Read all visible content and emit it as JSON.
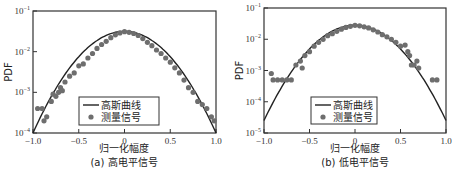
{
  "chart_data": [
    {
      "type": "scatter",
      "panel": "(a)",
      "title": "高电平信号",
      "caption": "(a) 高电平信号",
      "xlabel": "归一化幅度",
      "ylabel": "PDF",
      "xlim": [
        -1.0,
        1.0
      ],
      "ylim": [
        0.0001,
        0.1
      ],
      "yscale": "log",
      "xticks": [
        "-1.0",
        "-0.5",
        "0",
        "0.5",
        "1.0"
      ],
      "yticks": [
        "10^-1",
        "10^-2",
        "10^-3",
        "10^-4"
      ],
      "legend": {
        "position": "lower center",
        "entries": [
          "高斯曲线",
          "测量信号"
        ]
      },
      "series": [
        {
          "name": "高斯曲线",
          "kind": "line",
          "peak": 0.032,
          "log10_peak": -1.5,
          "log10_at_edges": -4.0
        },
        {
          "name": "测量信号",
          "kind": "scatter",
          "points": [
            [
              -0.95,
              0.0004
            ],
            [
              -0.9,
              0.0004
            ],
            [
              -0.88,
              0.0002
            ],
            [
              -0.85,
              0.00025
            ],
            [
              -0.8,
              0.0006
            ],
            [
              -0.78,
              0.0009
            ],
            [
              -0.75,
              0.0008
            ],
            [
              -0.72,
              0.001
            ],
            [
              -0.7,
              0.0013
            ],
            [
              -0.68,
              0.0011
            ],
            [
              -0.65,
              0.0018
            ],
            [
              -0.6,
              0.0025
            ],
            [
              -0.55,
              0.003
            ],
            [
              -0.5,
              0.0045
            ],
            [
              -0.45,
              0.005
            ],
            [
              -0.4,
              0.007
            ],
            [
              -0.35,
              0.009
            ],
            [
              -0.3,
              0.012
            ],
            [
              -0.25,
              0.015
            ],
            [
              -0.2,
              0.018
            ],
            [
              -0.15,
              0.022
            ],
            [
              -0.1,
              0.026
            ],
            [
              -0.05,
              0.029
            ],
            [
              0.0,
              0.031
            ],
            [
              0.05,
              0.03
            ],
            [
              0.1,
              0.028
            ],
            [
              0.15,
              0.025
            ],
            [
              0.2,
              0.021
            ],
            [
              0.25,
              0.017
            ],
            [
              0.3,
              0.014
            ],
            [
              0.35,
              0.011
            ],
            [
              0.4,
              0.009
            ],
            [
              0.45,
              0.007
            ],
            [
              0.5,
              0.0055
            ],
            [
              0.55,
              0.004
            ],
            [
              0.6,
              0.003
            ],
            [
              0.65,
              0.002
            ],
            [
              0.7,
              0.0013
            ],
            [
              0.75,
              0.001
            ],
            [
              0.8,
              0.0006
            ],
            [
              0.85,
              0.0005
            ],
            [
              0.9,
              0.0004
            ],
            [
              0.95,
              0.00025
            ],
            [
              0.98,
              0.0002
            ]
          ]
        }
      ]
    },
    {
      "type": "scatter",
      "panel": "(b)",
      "title": "低电平信号",
      "caption": "(b) 低电平信号",
      "xlabel": "归一化幅度",
      "ylabel": "PDF",
      "xlim": [
        -1.0,
        1.0
      ],
      "ylim": [
        1e-05,
        0.1
      ],
      "yscale": "log",
      "xticks": [
        "-1.0",
        "-0.5",
        "0",
        "0.5",
        "1.0"
      ],
      "yticks": [
        "10^-1",
        "10^-2",
        "10^-3",
        "10^-4",
        "10^-5"
      ],
      "legend": {
        "position": "lower center",
        "entries": [
          "高斯曲线",
          "测量信号"
        ]
      },
      "series": [
        {
          "name": "高斯曲线",
          "kind": "line",
          "peak": 0.028,
          "log10_peak": -1.55,
          "log10_at_edges": -4.6
        },
        {
          "name": "测量信号",
          "kind": "scatter",
          "points": [
            [
              -0.92,
              0.0008
            ],
            [
              -0.9,
              0.0005
            ],
            [
              -0.85,
              0.0005
            ],
            [
              -0.8,
              0.0005
            ],
            [
              -0.75,
              0.0005
            ],
            [
              -0.7,
              0.0005
            ],
            [
              -0.65,
              0.0015
            ],
            [
              -0.6,
              0.002
            ],
            [
              -0.58,
              0.0012
            ],
            [
              -0.55,
              0.003
            ],
            [
              -0.5,
              0.004
            ],
            [
              -0.45,
              0.006
            ],
            [
              -0.4,
              0.008
            ],
            [
              -0.35,
              0.01
            ],
            [
              -0.3,
              0.013
            ],
            [
              -0.25,
              0.015
            ],
            [
              -0.2,
              0.018
            ],
            [
              -0.15,
              0.021
            ],
            [
              -0.1,
              0.024
            ],
            [
              -0.05,
              0.026
            ],
            [
              0.0,
              0.028
            ],
            [
              0.05,
              0.027
            ],
            [
              0.1,
              0.025
            ],
            [
              0.15,
              0.023
            ],
            [
              0.2,
              0.02
            ],
            [
              0.25,
              0.017
            ],
            [
              0.3,
              0.014
            ],
            [
              0.35,
              0.012
            ],
            [
              0.4,
              0.01
            ],
            [
              0.45,
              0.008
            ],
            [
              0.5,
              0.006
            ],
            [
              0.55,
              0.0065
            ],
            [
              0.58,
              0.004
            ],
            [
              0.6,
              0.003
            ],
            [
              0.62,
              0.0015
            ],
            [
              0.65,
              0.0015
            ],
            [
              0.68,
              0.002
            ],
            [
              0.7,
              0.0012
            ],
            [
              0.85,
              0.0005
            ],
            [
              0.9,
              0.0005
            ]
          ]
        }
      ]
    }
  ]
}
